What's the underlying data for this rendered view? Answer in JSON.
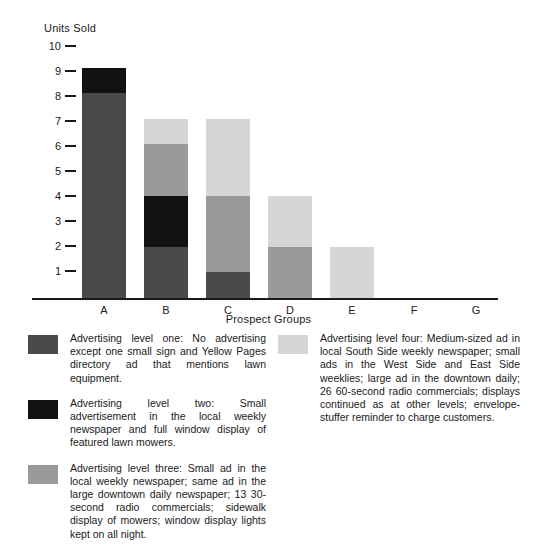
{
  "chart_data": {
    "type": "bar",
    "subtype": "stacked-bar",
    "title": "",
    "xlabel": "Prospect Groups",
    "ylabel": "Units Sold",
    "categories": [
      "A",
      "B",
      "C",
      "D",
      "E",
      "F",
      "G"
    ],
    "ylim": [
      0,
      10
    ],
    "yticks": [
      1,
      2,
      3,
      4,
      5,
      6,
      7,
      8,
      9,
      10
    ],
    "ytick_labels": [
      "1",
      "2",
      "3",
      "4",
      "5",
      "6",
      "7",
      "8",
      "9",
      "10"
    ],
    "grid": false,
    "legend_position": "below-plot-two-columns",
    "series": [
      {
        "name": "Advertising level one",
        "color": "#4a4a4a",
        "values": [
          8,
          2,
          1,
          0,
          0,
          0,
          0
        ]
      },
      {
        "name": "Advertising level two",
        "color": "#121212",
        "values": [
          1,
          2,
          0,
          0,
          0,
          0,
          0
        ]
      },
      {
        "name": "Advertising level three",
        "color": "#9a9a9a",
        "values": [
          0,
          2,
          3,
          2,
          0,
          0,
          0
        ]
      },
      {
        "name": "Advertising level four",
        "color": "#d6d6d6",
        "values": [
          0,
          1,
          3,
          2,
          2,
          0,
          0
        ]
      }
    ],
    "totals": [
      9,
      7,
      7,
      4,
      2,
      0,
      0
    ]
  },
  "axes": {
    "y_title": "Units Sold",
    "x_title": "Prospect Groups",
    "y_ticks": [
      "10",
      "9",
      "8",
      "7",
      "6",
      "5",
      "4",
      "3",
      "2",
      "1"
    ],
    "x_ticks": [
      "A",
      "B",
      "C",
      "D",
      "E",
      "F",
      "G"
    ]
  },
  "legend": {
    "left_column": [
      {
        "swatch_color": "#4a4a4a",
        "text": "Advertising level one: No advertising except one small sign and Yellow Pages directory ad that mentions lawn equipment."
      },
      {
        "swatch_color": "#121212",
        "text": "Advertising level two: Small advertisement in the local weekly newspaper and full window display of featured lawn mowers."
      },
      {
        "swatch_color": "#9a9a9a",
        "text": "Advertising level three: Small ad in the local weekly newspaper; same ad in the large downtown daily newspaper; 13 30-second radio commercials; sidewalk display of mowers; window display lights kept on all night."
      }
    ],
    "right_column": [
      {
        "swatch_color": "#d6d6d6",
        "text": "Advertising level four: Medium-sized ad in local South Side weekly newspaper; small ads in the West Side and East Side weeklies; large ad in the downtown daily; 26 60-second radio commercials; displays continued as at other levels; envelope-stuffer reminder to charge customers."
      }
    ]
  }
}
